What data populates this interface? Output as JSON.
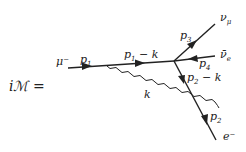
{
  "equation": {
    "lhs": "iℳ ="
  },
  "particles": {
    "incoming_muon": "μ⁻",
    "muon_neutrino": "ν",
    "muon_neutrino_sub": "μ",
    "electron_antineutrino": "ν̄",
    "electron_antineutrino_sub": "e",
    "electron": "e⁻"
  },
  "momenta": {
    "p1": "p",
    "p1_sub": "1",
    "p1_minus_k": "p",
    "p1_minus_k_sub": "1",
    "p1_minus_k_tail": " − k",
    "k": "k",
    "p3": "p",
    "p3_sub": "3",
    "p4": "p",
    "p4_sub": "4",
    "p2_minus_k": "p",
    "p2_minus_k_sub": "2",
    "p2_minus_k_tail": " − k",
    "p2": "p",
    "p2_sub": "2"
  }
}
